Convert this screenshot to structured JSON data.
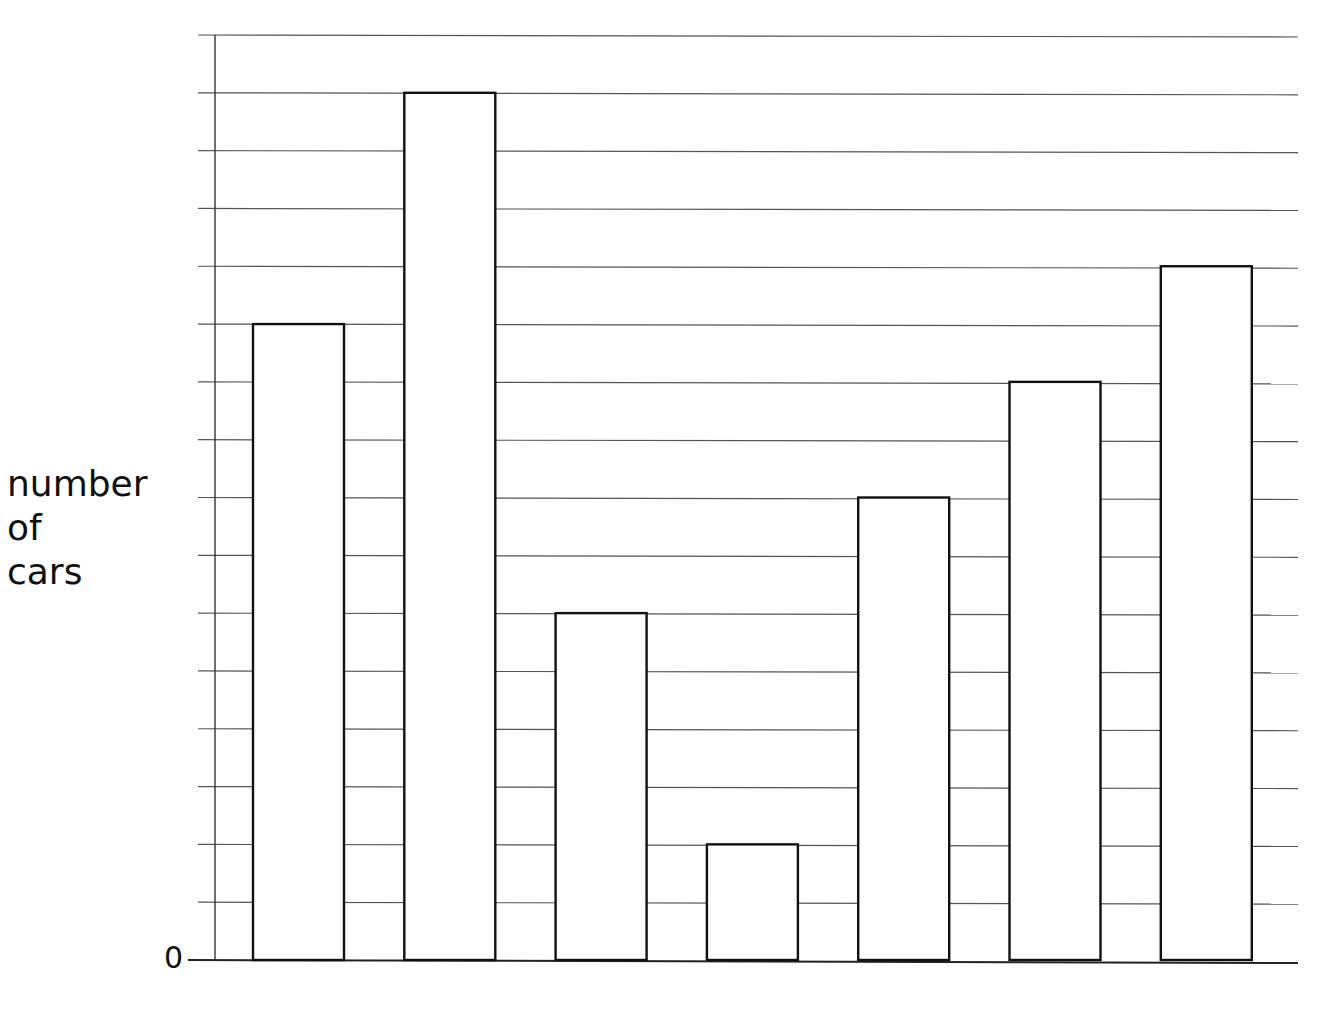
{
  "chart_data": {
    "type": "bar",
    "title": "",
    "xlabel": "",
    "ylabel": "number of cars",
    "ylabel_lines": [
      "number",
      "of",
      "cars"
    ],
    "y_tick_labels": [
      "0"
    ],
    "ylim": [
      0,
      16
    ],
    "grid": true,
    "gridline_step": 1,
    "categories": [
      "",
      "",
      "",
      "",
      "",
      "",
      ""
    ],
    "values": [
      11,
      15,
      6,
      2,
      8,
      10,
      12
    ],
    "bar_fill": "#ffffff",
    "bar_stroke": "#111111",
    "grid_color": "#555555",
    "legend": null
  }
}
